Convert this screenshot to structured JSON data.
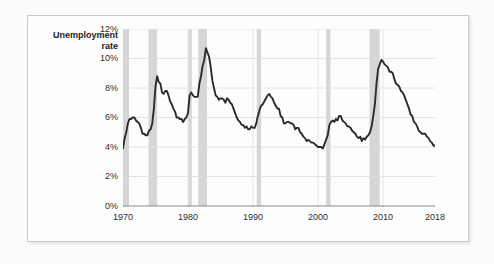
{
  "figure": {
    "top_caption": "",
    "axis_title_line1": "Unemployment",
    "axis_title_line2": "rate"
  },
  "colors": {
    "line": "#2b2b2b",
    "recession_band": "#d6d6d6",
    "gridline": "#d8dde3",
    "axis": "#8a8a8a",
    "frame": "#c9c9c9",
    "plot_background": "#fdfdfd",
    "page_background": "#fcfcfc",
    "tick_label": "#2e2e2e",
    "title": "#1c1c1c"
  },
  "chart_data": {
    "type": "line",
    "title": "",
    "xlabel": "",
    "ylabel": "Unemployment rate",
    "xlim": [
      1970,
      2018
    ],
    "ylim": [
      0,
      12
    ],
    "grid": true,
    "legend": "none",
    "y_ticks": [
      "0%",
      "2%",
      "4%",
      "6%",
      "8%",
      "10%",
      "12%"
    ],
    "y_tick_values": [
      0,
      2,
      4,
      6,
      8,
      10,
      12
    ],
    "x_ticks": [
      "1970",
      "1980",
      "1990",
      "2000",
      "2010",
      "2018"
    ],
    "x_tick_values": [
      1970,
      1980,
      1990,
      2000,
      2010,
      2018
    ],
    "y_unit": "percent",
    "series": [
      {
        "name": "Unemployment rate",
        "x": [
          1970.0,
          1970.25,
          1970.5,
          1970.75,
          1971.0,
          1971.25,
          1971.5,
          1971.75,
          1972.0,
          1972.25,
          1972.5,
          1972.75,
          1973.0,
          1973.25,
          1973.5,
          1973.75,
          1974.0,
          1974.25,
          1974.5,
          1974.75,
          1975.0,
          1975.25,
          1975.5,
          1975.75,
          1976.0,
          1976.25,
          1976.5,
          1976.75,
          1977.0,
          1977.25,
          1977.5,
          1977.75,
          1978.0,
          1978.25,
          1978.5,
          1978.75,
          1979.0,
          1979.25,
          1979.5,
          1979.75,
          1980.0,
          1980.25,
          1980.5,
          1980.75,
          1981.0,
          1981.25,
          1981.5,
          1981.75,
          1982.0,
          1982.25,
          1982.5,
          1982.75,
          1983.0,
          1983.25,
          1983.5,
          1983.75,
          1984.0,
          1984.25,
          1984.5,
          1984.75,
          1985.0,
          1985.25,
          1985.5,
          1985.75,
          1986.0,
          1986.25,
          1986.5,
          1986.75,
          1987.0,
          1987.25,
          1987.5,
          1987.75,
          1988.0,
          1988.25,
          1988.5,
          1988.75,
          1989.0,
          1989.25,
          1989.5,
          1989.75,
          1990.0,
          1990.25,
          1990.5,
          1990.75,
          1991.0,
          1991.25,
          1991.5,
          1991.75,
          1992.0,
          1992.25,
          1992.5,
          1992.75,
          1993.0,
          1993.25,
          1993.5,
          1993.75,
          1994.0,
          1994.25,
          1994.5,
          1994.75,
          1995.0,
          1995.25,
          1995.5,
          1995.75,
          1996.0,
          1996.25,
          1996.5,
          1996.75,
          1997.0,
          1997.25,
          1997.5,
          1997.75,
          1998.0,
          1998.25,
          1998.5,
          1998.75,
          1999.0,
          1999.25,
          1999.5,
          1999.75,
          2000.0,
          2000.25,
          2000.5,
          2000.75,
          2001.0,
          2001.25,
          2001.5,
          2001.75,
          2002.0,
          2002.25,
          2002.5,
          2002.75,
          2003.0,
          2003.25,
          2003.5,
          2003.75,
          2004.0,
          2004.25,
          2004.5,
          2004.75,
          2005.0,
          2005.25,
          2005.5,
          2005.75,
          2006.0,
          2006.25,
          2006.5,
          2006.75,
          2007.0,
          2007.25,
          2007.5,
          2007.75,
          2008.0,
          2008.25,
          2008.5,
          2008.75,
          2009.0,
          2009.25,
          2009.5,
          2009.75,
          2010.0,
          2010.25,
          2010.5,
          2010.75,
          2011.0,
          2011.25,
          2011.5,
          2011.75,
          2012.0,
          2012.25,
          2012.5,
          2012.75,
          2013.0,
          2013.25,
          2013.5,
          2013.75,
          2014.0,
          2014.25,
          2014.5,
          2014.75,
          2015.0,
          2015.25,
          2015.5,
          2015.75,
          2016.0,
          2016.25,
          2016.5,
          2016.75,
          2017.0,
          2017.25,
          2017.5,
          2017.75,
          2018.0,
          2018.25,
          2018.5
        ],
        "values": [
          3.9,
          4.6,
          5.0,
          5.6,
          5.9,
          5.9,
          6.0,
          6.0,
          5.8,
          5.7,
          5.6,
          5.3,
          4.9,
          4.9,
          4.8,
          4.8,
          5.1,
          5.2,
          5.6,
          6.6,
          8.1,
          8.8,
          8.4,
          8.3,
          7.7,
          7.6,
          7.8,
          7.8,
          7.5,
          7.1,
          6.9,
          6.6,
          6.4,
          6.0,
          6.0,
          5.9,
          5.9,
          5.7,
          5.9,
          6.0,
          6.3,
          7.5,
          7.7,
          7.5,
          7.4,
          7.4,
          7.4,
          8.3,
          8.8,
          9.5,
          9.9,
          10.7,
          10.4,
          10.1,
          9.4,
          8.5,
          8.0,
          7.5,
          7.4,
          7.2,
          7.3,
          7.3,
          7.2,
          7.0,
          7.3,
          7.2,
          7.0,
          6.9,
          6.6,
          6.3,
          6.0,
          5.8,
          5.7,
          5.5,
          5.5,
          5.3,
          5.4,
          5.2,
          5.2,
          5.4,
          5.3,
          5.3,
          5.6,
          6.1,
          6.5,
          6.8,
          6.9,
          7.1,
          7.3,
          7.5,
          7.6,
          7.4,
          7.3,
          7.0,
          6.8,
          6.6,
          6.6,
          6.1,
          6.0,
          5.6,
          5.6,
          5.7,
          5.7,
          5.6,
          5.6,
          5.5,
          5.2,
          5.3,
          5.3,
          5.0,
          4.9,
          4.7,
          4.6,
          4.4,
          4.5,
          4.4,
          4.3,
          4.3,
          4.2,
          4.1,
          4.0,
          4.0,
          4.0,
          3.9,
          4.2,
          4.5,
          4.8,
          5.5,
          5.7,
          5.8,
          5.7,
          5.9,
          5.8,
          6.1,
          6.1,
          5.8,
          5.7,
          5.6,
          5.4,
          5.4,
          5.3,
          5.1,
          5.0,
          4.9,
          4.7,
          4.6,
          4.7,
          4.4,
          4.6,
          4.5,
          4.7,
          4.8,
          5.0,
          5.4,
          6.1,
          6.9,
          8.3,
          9.3,
          9.6,
          9.9,
          9.8,
          9.6,
          9.5,
          9.4,
          9.1,
          9.1,
          9.0,
          8.6,
          8.3,
          8.2,
          8.1,
          7.8,
          7.7,
          7.5,
          7.2,
          6.9,
          6.6,
          6.2,
          6.1,
          5.7,
          5.6,
          5.4,
          5.1,
          5.0,
          4.9,
          4.9,
          4.9,
          4.7,
          4.6,
          4.4,
          4.3,
          4.1,
          4.1,
          3.9,
          3.8
        ]
      }
    ],
    "recession_bands": [
      {
        "label": "1969-1970 recession",
        "start": 1970.0,
        "end": 1970.92
      },
      {
        "label": "1973-1975 recession",
        "start": 1973.92,
        "end": 1975.25
      },
      {
        "label": "1980 recession",
        "start": 1980.08,
        "end": 1980.58
      },
      {
        "label": "1981-1982 recession",
        "start": 1981.58,
        "end": 1982.92
      },
      {
        "label": "1990-1991 recession",
        "start": 1990.58,
        "end": 1991.25
      },
      {
        "label": "2001 recession",
        "start": 2001.25,
        "end": 2001.92
      },
      {
        "label": "2007-2009 recession",
        "start": 2007.92,
        "end": 2009.5
      }
    ]
  }
}
